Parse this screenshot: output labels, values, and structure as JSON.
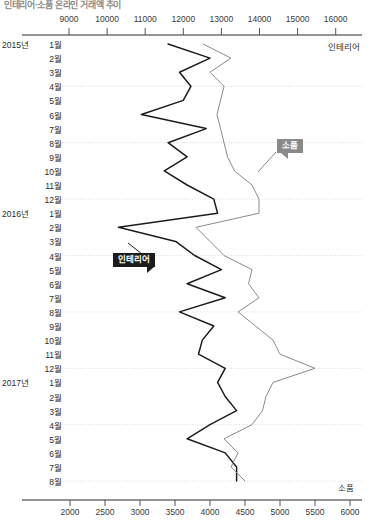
{
  "chart_data": {
    "type": "line",
    "orientation": "vertical-categories",
    "title": "인테리어·소품 온라인 거래액 추이",
    "categories": [
      "2015년 1월",
      "2월",
      "3월",
      "4월",
      "5월",
      "6월",
      "7월",
      "8월",
      "9월",
      "10월",
      "11월",
      "12월",
      "2016년 1월",
      "2월",
      "3월",
      "4월",
      "5월",
      "6월",
      "7월",
      "8월",
      "9월",
      "10월",
      "11월",
      "12월",
      "2017년 1월",
      "2월",
      "3월",
      "4월",
      "5월",
      "6월",
      "7월",
      "8월"
    ],
    "months": [
      "1월",
      "2월",
      "3월",
      "4월",
      "5월",
      "6월",
      "7월",
      "8월",
      "9월",
      "10월",
      "11월",
      "12월",
      "1월",
      "2월",
      "3월",
      "4월",
      "5월",
      "6월",
      "7월",
      "8월",
      "9월",
      "10월",
      "11월",
      "12월",
      "1월",
      "2월",
      "3월",
      "4월",
      "5월",
      "6월",
      "7월",
      "8월"
    ],
    "years": [
      {
        "label": "2015년",
        "index": 0
      },
      {
        "label": "2016년",
        "index": 12
      },
      {
        "label": "2017년",
        "index": 24
      }
    ],
    "top_axis": {
      "name": "인테리어",
      "ticks": [
        9000,
        10000,
        11000,
        12000,
        13000,
        14000,
        15000,
        16000
      ],
      "tick_labels": [
        "9000",
        "10000",
        "11000",
        "12000",
        "13000",
        "14000",
        "15000",
        "16000"
      ],
      "min": 9000,
      "max": 16000,
      "position": "top"
    },
    "bottom_axis": {
      "name": "소품",
      "ticks": [
        2000,
        2500,
        3000,
        3500,
        4000,
        4500,
        5000,
        5500,
        6000
      ],
      "tick_labels": [
        "2000",
        "2500",
        "3000",
        "3500",
        "4000",
        "4500",
        "5000",
        "5500",
        "6000"
      ],
      "min": 2000,
      "max": 6000,
      "position": "bottom"
    },
    "grid": true,
    "legend_position": "inline-callout",
    "series": [
      {
        "name": "인테리어",
        "axis": "top",
        "color": "#1c1c1c",
        "values": [
          11600,
          12700,
          11900,
          12200,
          12000,
          10900,
          12600,
          11600,
          12100,
          11500,
          12100,
          12800,
          12900,
          10300,
          11800,
          12300,
          13000,
          12100,
          13100,
          11900,
          12800,
          12500,
          12400,
          13100,
          12900,
          13100,
          13400,
          12700,
          12100,
          13100,
          13400,
          13400
        ]
      },
      {
        "name": "소품",
        "axis": "bottom",
        "color": "#8a8a8a",
        "values": [
          3900,
          4300,
          4000,
          4200,
          4150,
          4100,
          4150,
          4200,
          4250,
          4350,
          4600,
          4700,
          4700,
          3800,
          4000,
          4200,
          4600,
          4550,
          4700,
          4400,
          4650,
          4900,
          5000,
          5500,
          4900,
          4800,
          4750,
          4600,
          4200,
          4400,
          4300,
          4500
        ]
      }
    ],
    "annotations": [
      {
        "label": "인테리어",
        "style": "dark",
        "x": 113,
        "y": 253
      },
      {
        "label": "소품",
        "style": "grey",
        "x": 277,
        "y": 139
      }
    ]
  }
}
